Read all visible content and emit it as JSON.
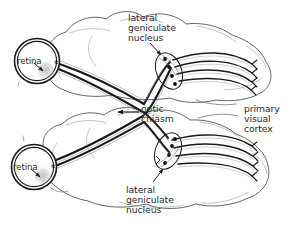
{
  "figure": {
    "background_color": "#ffffff",
    "ink_color": "#1a1a1a",
    "text_color": "#2b2b2b",
    "width": 295,
    "height": 229
  },
  "labels": {
    "lgn_top": {
      "line1": "lateral",
      "line2": "geniculate",
      "line3": "nucleus"
    },
    "lgn_bottom": {
      "line1": "lateral",
      "line2": "geniculate",
      "line3": "nucleus"
    },
    "optic_chiasm": {
      "line1": "optic",
      "line2": "chiasm"
    },
    "primary_visual_cortex": {
      "line1": "primary",
      "line2": "visual",
      "line3": "cortex"
    },
    "retina_top": "retina",
    "retina_bottom": "retina"
  },
  "structures": [
    {
      "name": "retina-top",
      "kind": "eye-circle"
    },
    {
      "name": "retina-bottom",
      "kind": "eye-circle"
    },
    {
      "name": "brain-top",
      "kind": "hemisphere-outline"
    },
    {
      "name": "brain-bottom",
      "kind": "hemisphere-outline"
    },
    {
      "name": "lgn-top",
      "kind": "ellipse-nucleus"
    },
    {
      "name": "lgn-bottom",
      "kind": "ellipse-nucleus"
    },
    {
      "name": "optic-chiasm",
      "kind": "fiber-crossing"
    },
    {
      "name": "optic-radiation-top",
      "kind": "fiber-bundle"
    },
    {
      "name": "optic-radiation-bottom",
      "kind": "fiber-bundle"
    }
  ],
  "leader_lines": {
    "lgn_top_arrow": "down-right",
    "lgn_bottom_arrow": "up-right",
    "chiasm_arrow": "left",
    "retina_top_arrow": "down-right",
    "retina_bottom_arrow": "down-right"
  }
}
